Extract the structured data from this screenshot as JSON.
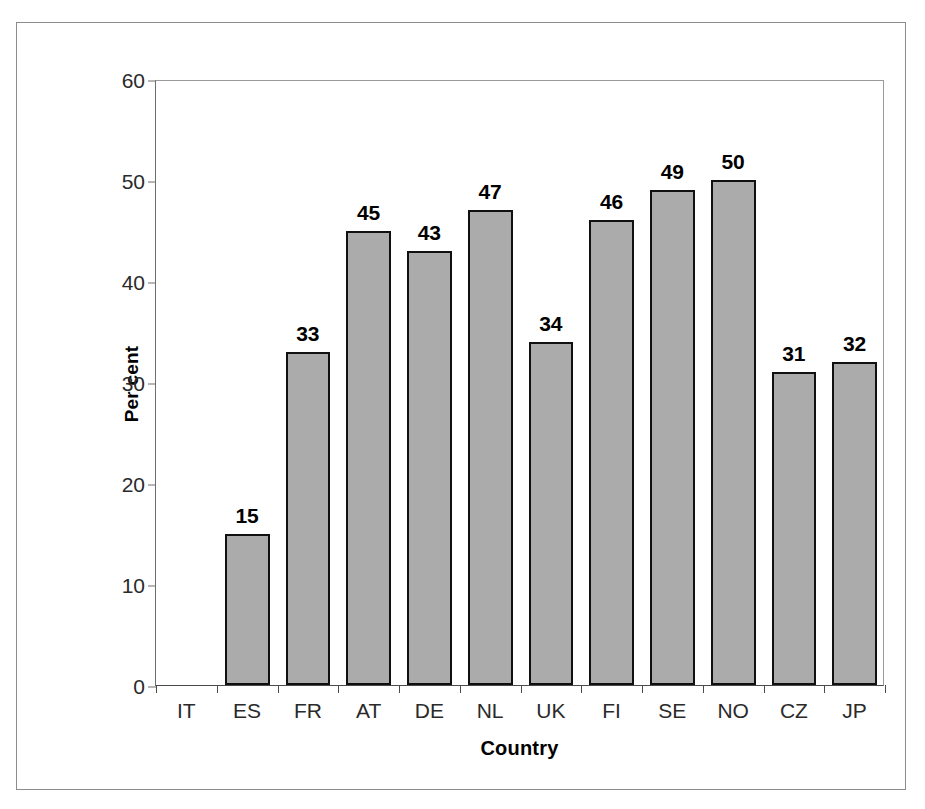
{
  "chart_data": {
    "type": "bar",
    "title": "",
    "xlabel": "Country",
    "ylabel": "Per cent",
    "categories": [
      "IT",
      "ES",
      "FR",
      "AT",
      "DE",
      "NL",
      "UK",
      "FI",
      "SE",
      "NO",
      "CZ",
      "JP"
    ],
    "values": [
      0,
      15,
      33,
      45,
      43,
      47,
      34,
      46,
      49,
      50,
      31,
      32
    ],
    "data_labels": [
      "",
      "15",
      "33",
      "45",
      "43",
      "47",
      "34",
      "46",
      "49",
      "50",
      "31",
      "32"
    ],
    "ylim": [
      0,
      60
    ],
    "ytick_labels": [
      "60",
      "50",
      "40",
      "30",
      "20",
      "10",
      "0"
    ],
    "ytick_values": [
      60,
      50,
      40,
      30,
      20,
      10,
      0
    ],
    "ytick_step": 10,
    "grid": false,
    "legend": false,
    "legend_position": "none",
    "bar_fill_color": "#ababab",
    "bar_border_color": "#101010",
    "axis_color": "#4a4a4a",
    "text_color": "#000000",
    "background_color": "#ffffff"
  },
  "axes": {
    "y_title": "Per cent",
    "x_title": "Country"
  },
  "figure": {
    "frame_color": "#8c8c8c",
    "bottom_sliver_text": ""
  }
}
